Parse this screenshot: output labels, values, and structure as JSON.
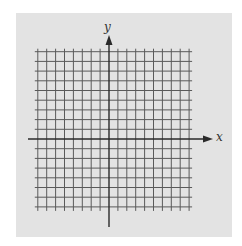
{
  "figure": {
    "type": "coordinate-plane",
    "x_axis_label": "x",
    "y_axis_label": "y",
    "vertical_gridlines_left_of_y_axis": 8,
    "vertical_gridlines_right_of_y_axis": 9,
    "horizontal_gridlines_above_x_axis": 9,
    "horizontal_gridlines_below_x_axis": 7,
    "colors": {
      "page_background": "#ffffff",
      "panel_background": "#e3e3e3",
      "grid_line": "#5a5a5a",
      "axis_line": "#2a2a2a"
    }
  }
}
